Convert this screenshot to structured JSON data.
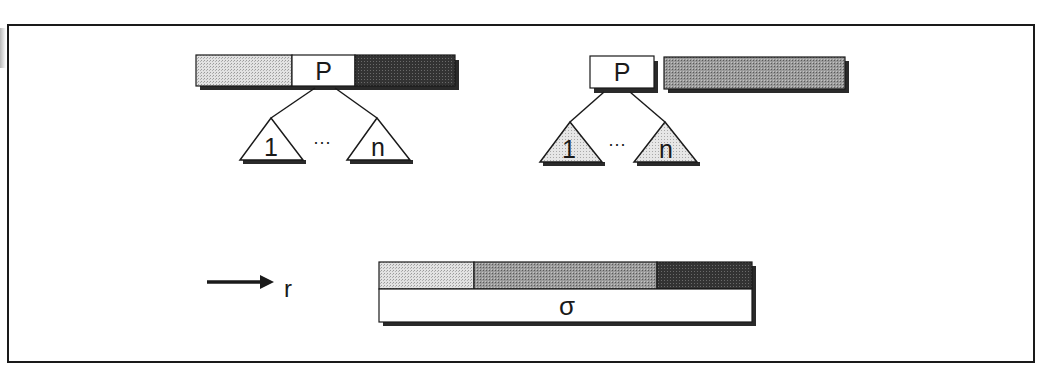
{
  "figure": {
    "colors": {
      "frame": "#1a1a1a",
      "light_fill": "#d4d4d4",
      "medium_fill": "#8c8c8c",
      "dark_fill": "#333333",
      "white_fill": "#ffffff",
      "shadow": "#2a2a2a"
    },
    "left_tree": {
      "node_label": "P",
      "children": [
        {
          "label": "1",
          "shaded": false
        },
        {
          "label": "n",
          "shaded": false
        }
      ],
      "ellipsis": "···",
      "bar_segments": [
        "light",
        "node",
        "dark"
      ]
    },
    "right_tree": {
      "node_label": "P",
      "children": [
        {
          "label": "1",
          "shaded": true
        },
        {
          "label": "n",
          "shaded": true
        }
      ],
      "ellipsis": "···",
      "bar_segments": [
        "node",
        "medium"
      ]
    },
    "arrow": {
      "label": "r"
    },
    "result_bar": {
      "label": "σ",
      "segments": [
        "light",
        "medium",
        "dark"
      ]
    }
  }
}
